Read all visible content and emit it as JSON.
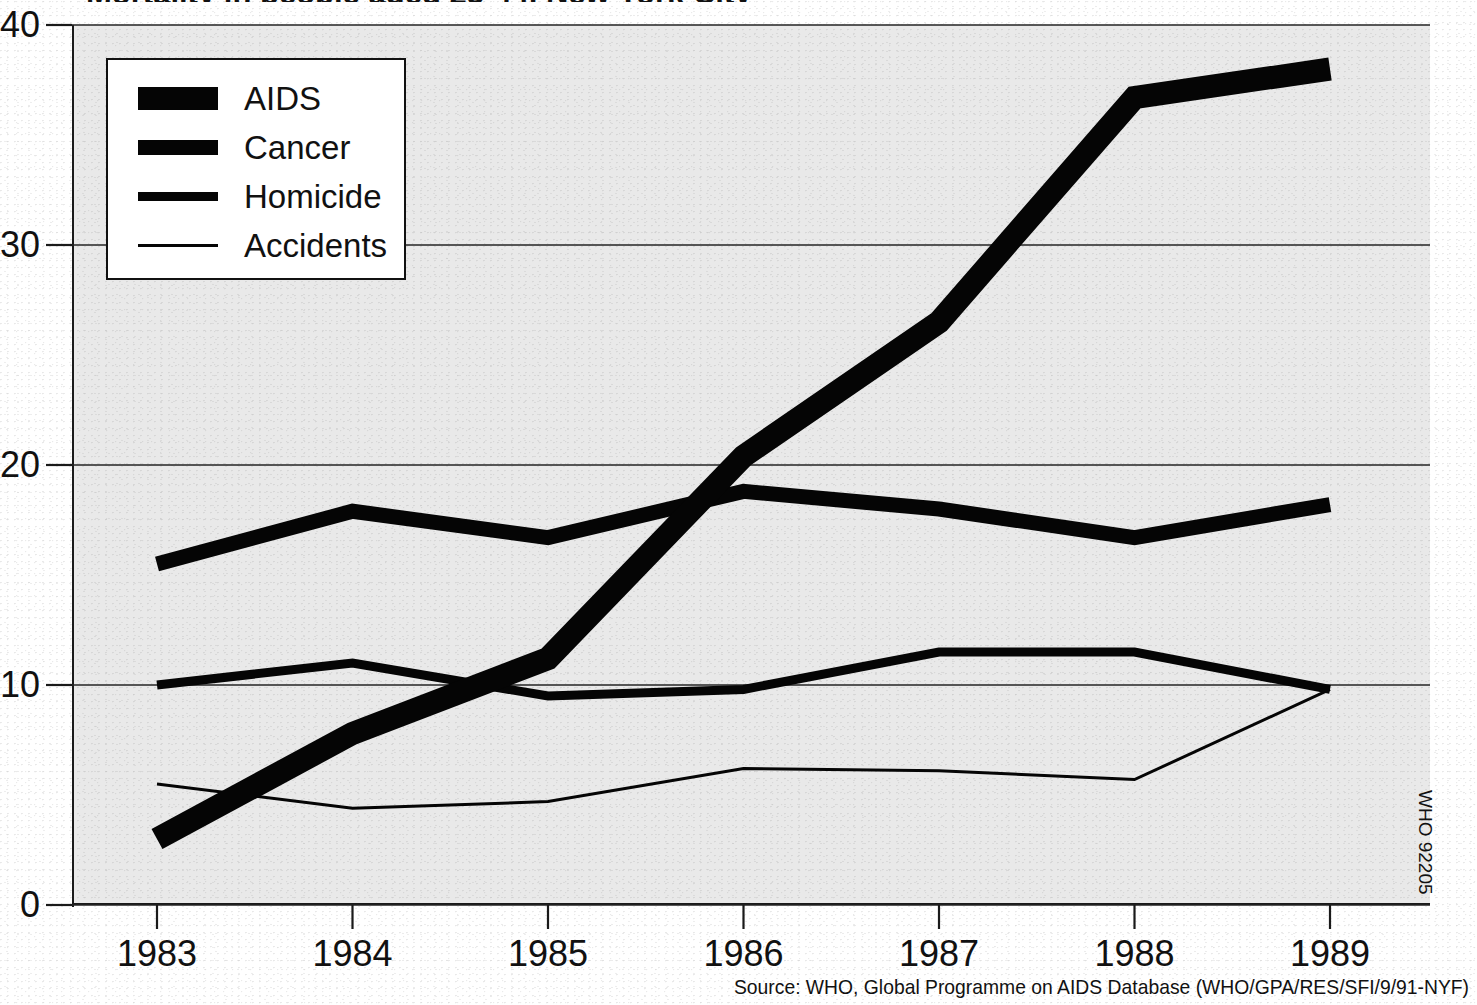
{
  "title": "Mortality in people aged 25-44, New York City",
  "source_note": "Source: WHO, Global Programme on AIDS Database (WHO/GPA/RES/SFI/9/91-NYF)",
  "who_code": "WHO 92205",
  "legend": {
    "items": [
      {
        "label": "AIDS",
        "swatch": "thick-bar-icon",
        "weight": 23
      },
      {
        "label": "Cancer",
        "swatch": "medium-bar-icon",
        "weight": 15
      },
      {
        "label": "Homicide",
        "swatch": "thin-bar-icon",
        "weight": 9
      },
      {
        "label": "Accidents",
        "swatch": "hairline-bar-icon",
        "weight": 3
      }
    ]
  },
  "axes": {
    "y_ticks": [
      "0",
      "10",
      "20",
      "30",
      "40"
    ],
    "x_ticks": [
      "1983",
      "1984",
      "1985",
      "1986",
      "1987",
      "1988",
      "1989"
    ]
  },
  "colors": {
    "ink": "#050505",
    "plot_background": "#e9e9e9",
    "page_background": "#ffffff",
    "gridline": "#232323"
  },
  "chart_data": {
    "type": "line",
    "title": "Mortality in people aged 25-44, New York City",
    "xlabel": "",
    "ylabel": "",
    "x": [
      1983,
      1984,
      1985,
      1986,
      1987,
      1988,
      1989
    ],
    "categories": [
      "1983",
      "1984",
      "1985",
      "1986",
      "1987",
      "1988",
      "1989"
    ],
    "ylim": [
      0,
      40
    ],
    "xlim": [
      1983,
      1989
    ],
    "yticks": [
      0,
      10,
      20,
      30,
      40
    ],
    "grid": true,
    "legend_position": "upper-left",
    "series": [
      {
        "name": "AIDS",
        "line_weight": 23,
        "values": [
          3.0,
          7.8,
          11.2,
          20.4,
          26.5,
          36.7,
          38.0
        ]
      },
      {
        "name": "Cancer",
        "line_weight": 15,
        "values": [
          15.5,
          17.9,
          16.7,
          18.8,
          18.0,
          16.7,
          18.2
        ]
      },
      {
        "name": "Homicide",
        "line_weight": 9,
        "values": [
          10.0,
          11.0,
          9.5,
          9.8,
          11.5,
          11.5,
          9.8
        ]
      },
      {
        "name": "Accidents",
        "line_weight": 3,
        "values": [
          5.5,
          4.4,
          4.7,
          6.2,
          6.1,
          5.7,
          9.8
        ]
      }
    ],
    "annotations": [
      "Source: WHO, Global Programme on AIDS Database (WHO/GPA/RES/SFI/9/91-NYF)",
      "WHO 92205"
    ]
  }
}
